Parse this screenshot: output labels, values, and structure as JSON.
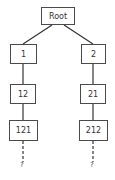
{
  "diagram": {
    "type": "tree",
    "root": {
      "label": "Root"
    },
    "nodes": [
      {
        "id": "root",
        "label": "Root"
      },
      {
        "id": "n1",
        "label": "1"
      },
      {
        "id": "n2",
        "label": "2"
      },
      {
        "id": "n12",
        "label": "12"
      },
      {
        "id": "n21",
        "label": "21"
      },
      {
        "id": "n121",
        "label": "121"
      },
      {
        "id": "n212",
        "label": "212"
      },
      {
        "id": "q1",
        "label": "?"
      },
      {
        "id": "q2",
        "label": "?"
      }
    ],
    "edges": [
      {
        "from": "Root",
        "to": "1",
        "style": "solid"
      },
      {
        "from": "Root",
        "to": "2",
        "style": "solid"
      },
      {
        "from": "1",
        "to": "12",
        "style": "solid"
      },
      {
        "from": "2",
        "to": "21",
        "style": "solid"
      },
      {
        "from": "12",
        "to": "121",
        "style": "solid"
      },
      {
        "from": "21",
        "to": "212",
        "style": "solid"
      },
      {
        "from": "121",
        "to": "?",
        "style": "dashed"
      },
      {
        "from": "212",
        "to": "?",
        "style": "dashed"
      }
    ]
  },
  "labels": {
    "root": "Root",
    "n1": "1",
    "n2": "2",
    "n12": "12",
    "n21": "21",
    "n121": "121",
    "n212": "212",
    "q_left": "?",
    "q_right": "?"
  },
  "colors": {
    "line": "#333333",
    "box_border": "#4a4a4a",
    "background": "#ffffff"
  }
}
